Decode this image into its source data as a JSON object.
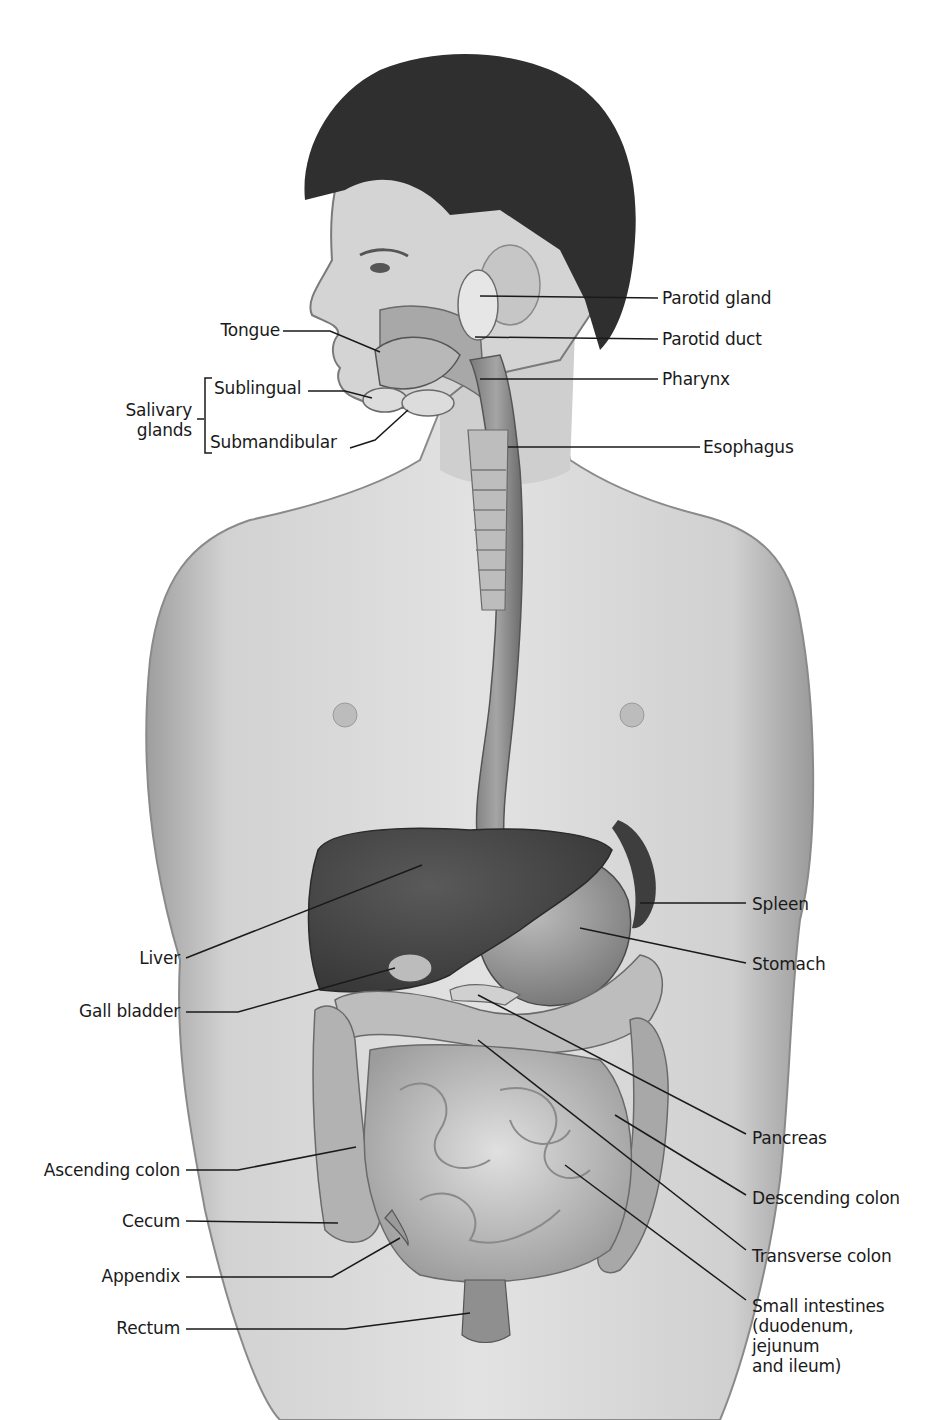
{
  "figure": {
    "colors": {
      "skin": "#d6d6d6",
      "skin_shadow": "#a8a8a8",
      "hair": "#2e2e2e",
      "liver": "#4a4a4a",
      "stomach": "#9a9a9a",
      "intestines": "#c4c4c4",
      "colon": "#a0a0a0",
      "leader_line": "#1a1a1a"
    }
  },
  "labels": {
    "tongue": "Tongue",
    "sublingual": "Sublingual",
    "salivary_glands": "Salivary\nglands",
    "submandibular": "Submandibular",
    "parotid_gland": "Parotid gland",
    "parotid_duct": "Parotid duct",
    "pharynx": "Pharynx",
    "esophagus": "Esophagus",
    "liver": "Liver",
    "gall_bladder": "Gall bladder",
    "spleen": "Spleen",
    "stomach": "Stomach",
    "pancreas": "Pancreas",
    "descending_colon": "Descending colon",
    "transverse_colon": "Transverse colon",
    "small_intestines": "Small intestines\n(duodenum,\njejunum\nand ileum)",
    "ascending_colon": "Ascending colon",
    "cecum": "Cecum",
    "appendix": "Appendix",
    "rectum": "Rectum"
  }
}
